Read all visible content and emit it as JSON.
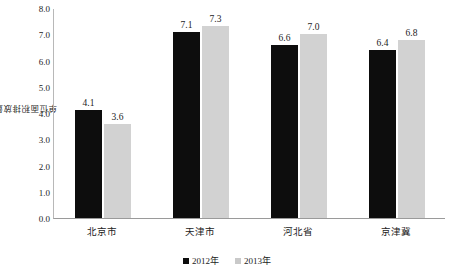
{
  "chart_data": {
    "type": "bar",
    "title": "",
    "xlabel": "",
    "ylabel": "单位面积排放量(t/km²)",
    "ylim": [
      0.0,
      8.0
    ],
    "ytick_step": 1.0,
    "grid": false,
    "legend_position": "bottom-center",
    "categories": [
      "北京市",
      "天津市",
      "河北省",
      "京津冀"
    ],
    "series": [
      {
        "name": "2012年",
        "color": "#0d0d0d",
        "values": [
          4.1,
          7.1,
          6.6,
          6.4
        ],
        "labels": [
          "4.1",
          "7.1",
          "6.6",
          "6.4"
        ]
      },
      {
        "name": "2013年",
        "color": "#d2d2d2",
        "values": [
          3.6,
          7.3,
          7.0,
          6.8
        ],
        "labels": [
          "3.6",
          "7.3",
          "7.0",
          "6.8"
        ]
      }
    ],
    "ytick_labels": [
      "8.0",
      "7.0",
      "6.0",
      "5.0",
      "4.0",
      "3.0",
      "2.0",
      "1.0",
      "0.0"
    ],
    "ytick_values": [
      8.0,
      7.0,
      6.0,
      5.0,
      4.0,
      3.0,
      2.0,
      1.0,
      0.0
    ]
  },
  "axis": {
    "y_title": "单位面积排放量(t/km²)"
  },
  "legend": {
    "items": [
      {
        "label": "2012年",
        "color": "#0d0d0d"
      },
      {
        "label": "2013年",
        "color": "#c9c9c9"
      }
    ]
  }
}
